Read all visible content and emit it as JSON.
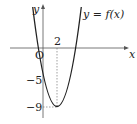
{
  "diagram": {
    "type": "function-graph",
    "function_label": "y = f(x)",
    "function_label_parts": {
      "y": "y",
      "eq": "=",
      "f": "f",
      "open": "(",
      "x": "x",
      "close": ")"
    },
    "axes": {
      "x_label": "x",
      "y_label": "y",
      "origin_label": "O"
    },
    "ticks": {
      "x_tick": "2",
      "y_tick_1": "−5",
      "y_tick_2": "−9"
    },
    "curve": {
      "kind": "parabola",
      "vertex": [
        2,
        -9
      ],
      "y_intercept": -5,
      "roots": [
        -1,
        5
      ]
    },
    "colors": {
      "curve": "#222222",
      "axis": "#555555",
      "guide": "#777777"
    }
  }
}
